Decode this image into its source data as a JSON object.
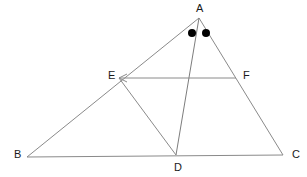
{
  "figure": {
    "type": "geometry-diagram",
    "canvas": {
      "width": 307,
      "height": 177
    },
    "background_color": "#ffffff",
    "line_color": "#8a8a8a",
    "label_color": "#1a1a1a",
    "mark_color": "#000000",
    "points": [
      {
        "id": "A",
        "label": "A",
        "x": 199,
        "y": 18,
        "label_x": 196,
        "label_y": 9
      },
      {
        "id": "B",
        "label": "B",
        "x": 27,
        "y": 157,
        "label_x": 14,
        "label_y": 155
      },
      {
        "id": "C",
        "label": "C",
        "x": 283,
        "y": 155,
        "label_x": 292,
        "label_y": 155
      },
      {
        "id": "D",
        "label": "D",
        "x": 176,
        "y": 155,
        "label_x": 174,
        "label_y": 168
      },
      {
        "id": "E",
        "label": "E",
        "x": 119,
        "y": 78,
        "label_x": 108,
        "label_y": 76
      },
      {
        "id": "F",
        "label": "F",
        "x": 236,
        "y": 78,
        "label_x": 243,
        "label_y": 76
      }
    ],
    "segments": [
      {
        "name": "AB",
        "from": "A",
        "to": "B"
      },
      {
        "name": "AC",
        "from": "A",
        "to": "C"
      },
      {
        "name": "BC",
        "from": "B",
        "to": "C"
      },
      {
        "name": "AD",
        "from": "A",
        "to": "D"
      },
      {
        "name": "EF",
        "from": "E",
        "to": "F"
      },
      {
        "name": "ED",
        "from": "E",
        "to": "D"
      }
    ],
    "arrows": [
      {
        "name": "EF-arrow-at-E",
        "on_segment": "EF",
        "at_point": "E",
        "direction": "left"
      }
    ],
    "angle_marks": [
      {
        "name": "angle-dot-BAD",
        "x": 192,
        "y": 33,
        "r": 4
      },
      {
        "name": "angle-dot-DAC",
        "x": 206,
        "y": 33,
        "r": 4
      }
    ]
  }
}
